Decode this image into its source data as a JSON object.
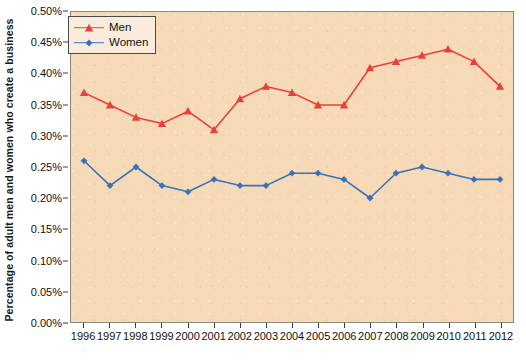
{
  "chart_data": {
    "type": "line",
    "title": "",
    "xlabel": "",
    "ylabel": "Percentage of adult men and women who create a business",
    "categories": [
      "1996",
      "1997",
      "1998",
      "1999",
      "2000",
      "2001",
      "2002",
      "2003",
      "2004",
      "2005",
      "2006",
      "2007",
      "2008",
      "2009",
      "2010",
      "2011",
      "2012"
    ],
    "x": [
      1996,
      1997,
      1998,
      1999,
      2000,
      2001,
      2002,
      2003,
      2004,
      2005,
      2006,
      2007,
      2008,
      2009,
      2010,
      2011,
      2012
    ],
    "ylim": [
      0.0,
      0.5
    ],
    "yticks": [
      0.0,
      0.05,
      0.1,
      0.15,
      0.2,
      0.25,
      0.3,
      0.35,
      0.4,
      0.45,
      0.5
    ],
    "ytick_labels": [
      "0.00%",
      "0.05%",
      "0.10%",
      "0.15%",
      "0.20%",
      "0.25%",
      "0.30%",
      "0.35%",
      "0.40%",
      "0.45%",
      "0.50%"
    ],
    "grid": false,
    "legend_position": "top-left",
    "series": [
      {
        "name": "Men",
        "color": "#e8413a",
        "marker": "triangle",
        "values": [
          0.37,
          0.35,
          0.33,
          0.32,
          0.34,
          0.31,
          0.36,
          0.38,
          0.37,
          0.35,
          0.35,
          0.41,
          0.42,
          0.43,
          0.44,
          0.42,
          0.38
        ]
      },
      {
        "name": "Women",
        "color": "#3a72b8",
        "marker": "diamond",
        "values": [
          0.26,
          0.22,
          0.25,
          0.22,
          0.21,
          0.23,
          0.22,
          0.22,
          0.24,
          0.24,
          0.23,
          0.2,
          0.24,
          0.25,
          0.24,
          0.23,
          0.23
        ]
      }
    ]
  },
  "legend": {
    "items": [
      {
        "label": "Men",
        "color": "#e8413a",
        "marker": "triangle"
      },
      {
        "label": "Women",
        "color": "#3a72b8",
        "marker": "diamond"
      }
    ]
  },
  "colors": {
    "plot_background": "#f6d9b6",
    "page_background": "#ffffff",
    "men_series": "#e8413a",
    "women_series": "#3a72b8",
    "axis": "#3b3b3b"
  }
}
